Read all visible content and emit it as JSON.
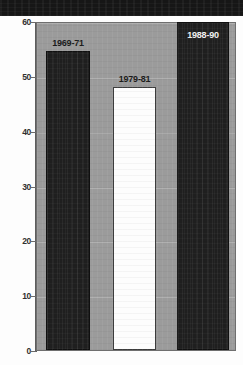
{
  "chart_data": {
    "type": "bar",
    "title": "",
    "subtitle": "",
    "xlabel": "",
    "ylabel": "",
    "categories": [
      "1969-71",
      "1979-81",
      "1988-90"
    ],
    "values": [
      54.5,
      48.0,
      59.8
    ],
    "ylim": [
      0,
      60
    ],
    "yticks": [
      0,
      10,
      20,
      30,
      40,
      50,
      60
    ],
    "ytick_labels": [
      "0",
      "10",
      "20",
      "30",
      "40",
      "50",
      "60"
    ],
    "grid": true,
    "legend": null,
    "series": [
      {
        "name": "value",
        "values": [
          54.5,
          48.0,
          59.8
        ]
      }
    ],
    "annotations": [
      {
        "text": "1969-71",
        "position": "above-bar",
        "bar_index": 0
      },
      {
        "text": "1979-81",
        "position": "above-bar",
        "bar_index": 1
      },
      {
        "text": "1988-90",
        "position": "inside-bar-top",
        "bar_index": 2
      }
    ],
    "bar_styles": [
      {
        "fill": "#1f1f1f",
        "label_color": "#1a1a1a"
      },
      {
        "fill": "#fdfdfd",
        "label_color": "#1a1a1a"
      },
      {
        "fill": "#1f1f1f",
        "label_color": "#f2f2f2"
      }
    ]
  },
  "figure": {
    "plot_background": "#9b9b9b",
    "page_background": "#fdfdfd",
    "header_band_color": "#161616",
    "axis_color": "#5d5d5d"
  }
}
